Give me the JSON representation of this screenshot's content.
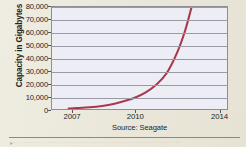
{
  "figure": {
    "background_color": "#ece9dd",
    "plot_background_color": "#edeef5",
    "curve_color": "#a8394a",
    "gridline_color": "#9a9aa6",
    "axis_color": "#54545c"
  },
  "chart_data": {
    "type": "line",
    "title": "",
    "subtitle": "",
    "xlabel": "",
    "ylabel": "Capacity in Gigabytes",
    "source": "Source: Seagate",
    "xlim": [
      2006.0,
      2014.4
    ],
    "ylim": [
      0,
      80000
    ],
    "grid": true,
    "legend_position": "none",
    "x_tick_labels": [
      "2007",
      "2010",
      "2014"
    ],
    "x_ticks": [
      2007,
      2010,
      2014
    ],
    "y_tick_labels": [
      "0",
      "10,000",
      "20,000",
      "30,000",
      "40,000",
      "50,000",
      "60,000",
      "70,000",
      "80,000"
    ],
    "y_ticks": [
      0,
      10000,
      20000,
      30000,
      40000,
      50000,
      60000,
      70000,
      80000
    ],
    "series": [
      {
        "name": "Hard drive capacity",
        "x": [
          2006.8,
          2007.2,
          2007.8,
          2008.4,
          2009.0,
          2009.6,
          2010.0,
          2010.5,
          2011.0,
          2011.5,
          2012.0,
          2012.4,
          2012.7
        ],
        "values": [
          400,
          700,
          1300,
          2400,
          4200,
          6800,
          9000,
          13000,
          19000,
          28000,
          44000,
          62000,
          80000
        ]
      }
    ],
    "annotations": []
  },
  "footer": {
    "cropped_body_text": "····· ········· ···· ······ ····· ······· ····· ···· ········ ····· ····"
  }
}
